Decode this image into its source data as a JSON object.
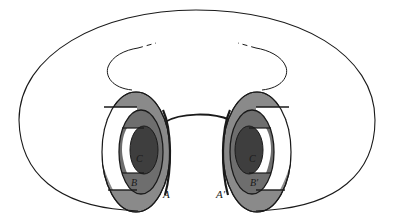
{
  "figure": {
    "colors": {
      "background": "#ffffff",
      "stroke": "#1a1a1a",
      "region_A": "#8a8a8a",
      "region_B": "#6e6e6e",
      "region_C": "#3e3e3e",
      "white_gap": "#ffffff"
    },
    "labels": {
      "left": {
        "A": "A",
        "B": "B",
        "C": "C"
      },
      "right": {
        "A": "A′",
        "B": "B′",
        "C": "C"
      }
    }
  }
}
